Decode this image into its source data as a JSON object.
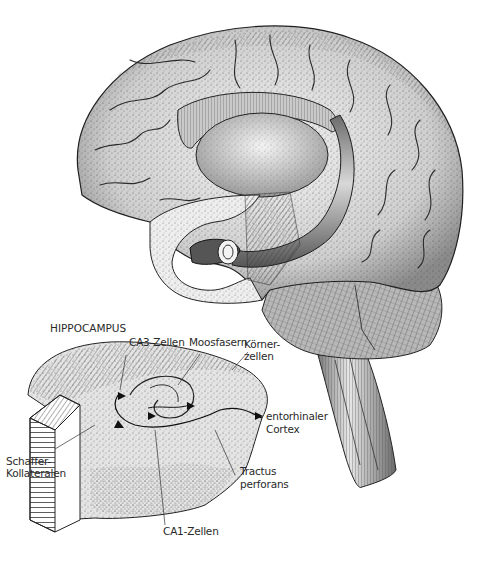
{
  "figure": {
    "inset_title": "HIPPOCAMPUS",
    "labels": [
      {
        "id": "ca3",
        "text": "CA3-Zellen"
      },
      {
        "id": "moos",
        "text": "Moosfasern"
      },
      {
        "id": "koerner_1",
        "text": "Körner-"
      },
      {
        "id": "koerner_2",
        "text": "zellen"
      },
      {
        "id": "ento_1",
        "text": "entorhinaler"
      },
      {
        "id": "ento_2",
        "text": "Cortex"
      },
      {
        "id": "schaffer_1",
        "text": "Schaffer-"
      },
      {
        "id": "schaffer_2",
        "text": "Kollateralen"
      },
      {
        "id": "tractus_1",
        "text": "Tractus"
      },
      {
        "id": "tractus_2",
        "text": "perforans"
      },
      {
        "id": "ca1",
        "text": "CA1-Zellen"
      }
    ]
  },
  "colors": {
    "background": "#ffffff",
    "ink": "#1e1e1e",
    "shade_light": "#e6e6e6",
    "shade_mid": "#bdbdbd",
    "shade_dark": "#7a7a7a"
  }
}
